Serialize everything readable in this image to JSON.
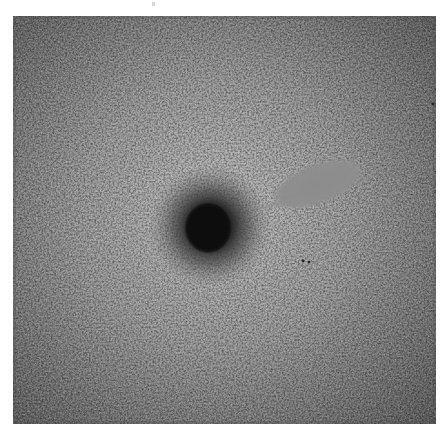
{
  "image": {
    "kind": "grayscale noisy micrograph",
    "colors": {
      "page_background": "#ffffff",
      "center_tone": "#bdbdbd",
      "mid_tone": "#9c9c9c",
      "edge_tone": "#5e5e5e",
      "dark_spot": "#060606",
      "gray_patch": "#8c8c8c",
      "speck": "#222222"
    },
    "features": [
      {
        "name": "dark-spot",
        "description": "dense dark circular blob with diffuse halo"
      },
      {
        "name": "gray-patch",
        "description": "smooth elongated uniform gray ellipse"
      },
      {
        "name": "specks",
        "description": "two tiny dark dots"
      }
    ]
  }
}
